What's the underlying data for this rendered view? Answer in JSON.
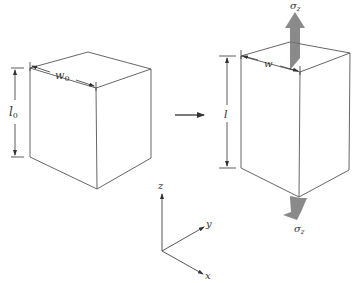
{
  "figure": {
    "initial_block": {
      "width_label": "w",
      "width_subscript": "0",
      "length_label": "l",
      "length_subscript": "0"
    },
    "transition_arrow": "right-arrow",
    "deformed_block": {
      "width_label": "w",
      "length_label": "l",
      "stress_top_label": "σ",
      "stress_top_subscript": "z",
      "stress_bottom_label": "σ",
      "stress_bottom_subscript": "z",
      "stress_arrow_color": "#8a8a8a"
    },
    "axes": {
      "z_label": "z",
      "y_label": "y",
      "x_label": "x"
    }
  }
}
